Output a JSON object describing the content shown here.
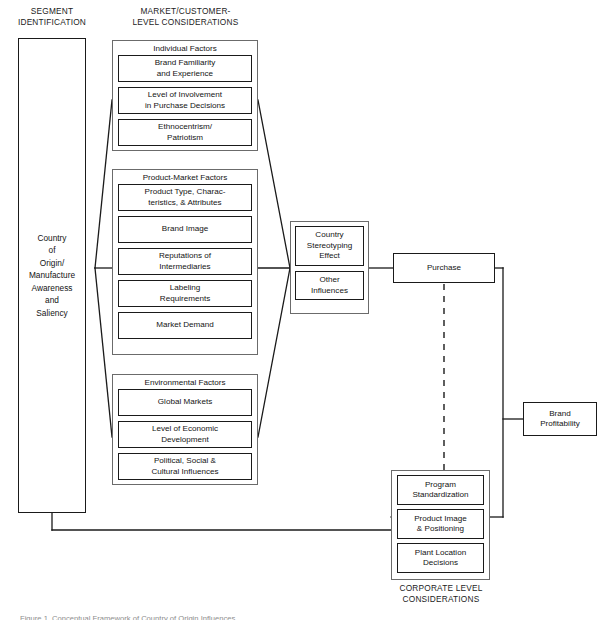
{
  "figure": {
    "headings": {
      "segment": "SEGMENT\nIDENTIFICATION",
      "market": "MARKET/CUSTOMER-\nLEVEL CONSIDERATIONS",
      "corporate": "CORPORATE LEVEL\nCONSIDERATIONS"
    },
    "caption": "Figure 1.  Conceptual Framework of Country of Origin Influences",
    "segment_box": {
      "label": "Country\nof\nOrigin/\nManufacture\nAwareness\nand\nSaliency"
    },
    "groups": [
      {
        "id": "individual-factors",
        "title": "Individual Factors",
        "items": [
          "Brand Familiarity\nand Experience",
          "Level of Involvement\nin Purchase Decisions",
          "Ethnocentrism/\nPatriotism"
        ]
      },
      {
        "id": "product-market-factors",
        "title": "Product-Market Factors",
        "items": [
          "Product Type, Charac-\nteristics, & Attributes",
          "Brand Image",
          "Reputations of\nIntermediaries",
          "Labeling\nRequirements",
          "Market Demand"
        ]
      },
      {
        "id": "environmental-factors",
        "title": "Environmental Factors",
        "items": [
          "Global Markets",
          "Level of Economic\nDevelopment",
          "Political, Social &\nCultural Influences"
        ]
      },
      {
        "id": "mediating-effects",
        "title": "",
        "items": [
          "Country\nStereotyping\nEffect",
          "Other\nInfluences"
        ]
      },
      {
        "id": "corporate-level",
        "title": "",
        "items": [
          "Program\nStandardization",
          "Product Image\n& Positioning",
          "Plant Location\nDecisions"
        ]
      }
    ],
    "outcomes": {
      "purchase": "Purchase",
      "brand_profitability": "Brand\nProfitability"
    },
    "colors": {
      "line": "#1a1a1a",
      "group_border": "#6b6b6b",
      "text": "#141414",
      "background": "#ffffff"
    }
  }
}
